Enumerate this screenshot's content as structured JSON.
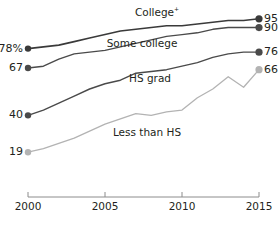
{
  "chart_data": {
    "type": "line",
    "title": "",
    "subtitle": "",
    "xlabel": "",
    "ylabel": "",
    "xlim": [
      2000,
      2015
    ],
    "ylim": [
      0,
      100
    ],
    "grid": false,
    "legend_position": "inline-labels",
    "x": [
      2000,
      2001,
      2002,
      2003,
      2004,
      2005,
      2006,
      2007,
      2008,
      2009,
      2010,
      2011,
      2012,
      2013,
      2014,
      2015
    ],
    "x_ticks": [
      "2000",
      "2005",
      "2010",
      "2015"
    ],
    "series": [
      {
        "name": "College+",
        "label": "College",
        "label_superscript": "+",
        "color": "#3a3a3a",
        "stroke_width": 1.6,
        "start_label": "78%",
        "end_label": "95",
        "start_value": 78,
        "end_value": 95,
        "values": [
          78,
          79,
          80,
          82,
          84,
          86,
          88,
          89,
          90,
          91,
          91,
          92,
          93,
          94,
          94,
          95
        ]
      },
      {
        "name": "Some college",
        "label": "Some college",
        "label_superscript": "",
        "color": "#4a4a4a",
        "stroke_width": 1.4,
        "start_label": "67",
        "end_label": "90",
        "start_value": 67,
        "end_value": 90,
        "values": [
          67,
          68,
          72,
          75,
          76,
          77,
          79,
          81,
          83,
          85,
          86,
          87,
          89,
          90,
          90,
          90
        ]
      },
      {
        "name": "HS grad",
        "label": "HS grad",
        "label_superscript": "",
        "color": "#4a4a4a",
        "stroke_width": 1.4,
        "start_label": "40",
        "end_label": "76",
        "start_value": 40,
        "end_value": 76,
        "values": [
          40,
          43,
          47,
          51,
          55,
          58,
          60,
          64,
          65,
          66,
          68,
          70,
          73,
          75,
          76,
          76
        ]
      },
      {
        "name": "Less than HS",
        "label": "Less than HS",
        "label_superscript": "",
        "color": "#b3b3b3",
        "stroke_width": 1.3,
        "start_label": "19",
        "end_label": "66",
        "start_value": 19,
        "end_value": 66,
        "values": [
          19,
          21,
          24,
          27,
          31,
          35,
          38,
          41,
          40,
          42,
          43,
          50,
          55,
          62,
          56,
          66
        ]
      }
    ],
    "inline_labels": [
      {
        "series": "College+",
        "text": "College",
        "sup": "+",
        "x": 157,
        "y": 6
      },
      {
        "series": "Some college",
        "text": "Some college",
        "sup": "",
        "x": 142,
        "y": 38
      },
      {
        "series": "HS grad",
        "text": "HS grad",
        "sup": "",
        "x": 150,
        "y": 73
      },
      {
        "series": "Less than HS",
        "text": "Less than HS",
        "sup": "",
        "x": 147,
        "y": 127
      }
    ]
  }
}
